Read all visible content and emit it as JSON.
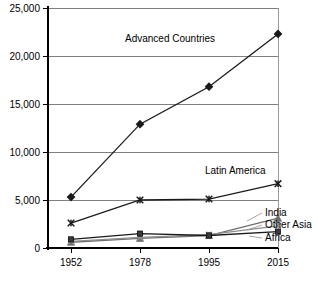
{
  "chart_data": {
    "type": "line",
    "title": "",
    "subtitle": "",
    "xlabel": "",
    "ylabel": "",
    "categories": [
      "1952",
      "1978",
      "1995",
      "2015"
    ],
    "x_tick_labels": [
      "1952",
      "1978",
      "1995",
      "2015"
    ],
    "y_tick_labels": [
      "0",
      "5,000",
      "10,000",
      "15,000",
      "20,000",
      "25,000"
    ],
    "y_tick_values": [
      0,
      5000,
      10000,
      15000,
      20000,
      25000
    ],
    "ylim": [
      0,
      25000
    ],
    "grid": "horizontal",
    "legend_position": "inline-right",
    "series": [
      {
        "name": "Advanced Countries",
        "marker": "diamond",
        "color": "#1a1a1a",
        "values": [
          5300,
          12900,
          16800,
          22300
        ],
        "label_position": "above-line-center"
      },
      {
        "name": "Latin America",
        "marker": "asterisk",
        "color": "#1a1a1a",
        "values": [
          2600,
          5000,
          5100,
          6700
        ],
        "label_position": "above-line-right"
      },
      {
        "name": "India",
        "marker": "triangle",
        "color": "#6e6e6e",
        "values": [
          600,
          1000,
          1300,
          3100
        ],
        "label_position": "right-end"
      },
      {
        "name": "Other Asia",
        "marker": "x",
        "color": "#8e8e8e",
        "values": [
          700,
          1100,
          1400,
          2300
        ],
        "label_position": "right-end"
      },
      {
        "name": "Africa",
        "marker": "square",
        "color": "#3a3a3a",
        "values": [
          900,
          1500,
          1300,
          1700
        ],
        "label_position": "right-end"
      }
    ],
    "annotations": [
      {
        "text": "Advanced Countries",
        "x": 125,
        "y": 42
      },
      {
        "text": "Latin America",
        "x": 205,
        "y": 174
      },
      {
        "text": "India",
        "x": 265,
        "y": 216
      },
      {
        "text": "Other Asia",
        "x": 265,
        "y": 228
      },
      {
        "text": "Africa",
        "x": 265,
        "y": 241
      }
    ],
    "colors": {
      "axis": "#000000",
      "grid": "#808080",
      "background": "#ffffff",
      "advanced_countries": "#1a1a1a",
      "latin_america": "#1a1a1a",
      "india": "#6e6e6e",
      "other_asia": "#8e8e8e",
      "africa": "#3a3a3a"
    }
  }
}
